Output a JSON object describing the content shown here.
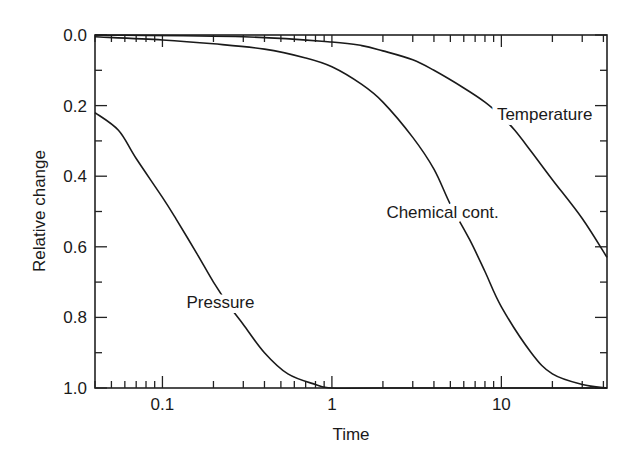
{
  "chart_data": {
    "type": "line",
    "title": "",
    "xlabel": "Time",
    "ylabel": "Relative change",
    "xscale": "log",
    "xlim": [
      0.04,
      42
    ],
    "ylim": [
      0.0,
      1.0
    ],
    "y_inverted": true,
    "grid": false,
    "legend": "none (inline curve labels)",
    "x_tick_labels": [
      "0.1",
      "1",
      "10"
    ],
    "x_tick_values": [
      0.1,
      1,
      10
    ],
    "y_tick_labels": [
      "0.0",
      "0.2",
      "0.4",
      "0.6",
      "0.8",
      "1.0"
    ],
    "y_tick_values": [
      0.0,
      0.2,
      0.4,
      0.6,
      0.8,
      1.0
    ],
    "series": [
      {
        "name": "Pressure",
        "label": "Pressure",
        "x": [
          0.04,
          0.055,
          0.07,
          0.1,
          0.12,
          0.16,
          0.2,
          0.25,
          0.3,
          0.4,
          0.55,
          0.8,
          1.0,
          2.0,
          42
        ],
        "values": [
          0.22,
          0.27,
          0.35,
          0.46,
          0.52,
          0.62,
          0.7,
          0.77,
          0.82,
          0.9,
          0.96,
          0.99,
          1.0,
          1.0,
          1.0
        ]
      },
      {
        "name": "Chemical cont.",
        "label": "Chemical cont.",
        "x": [
          0.04,
          0.1,
          0.2,
          0.4,
          0.7,
          1.0,
          1.5,
          2.0,
          3.0,
          4.0,
          5.0,
          6.5,
          8.0,
          10.0,
          15.0,
          20.0,
          30.0,
          42
        ],
        "values": [
          0.005,
          0.014,
          0.025,
          0.04,
          0.065,
          0.09,
          0.14,
          0.19,
          0.29,
          0.38,
          0.48,
          0.58,
          0.67,
          0.77,
          0.9,
          0.96,
          0.99,
          1.0
        ]
      },
      {
        "name": "Temperature",
        "label": "Temperature",
        "x": [
          0.04,
          0.3,
          1.0,
          1.5,
          2.0,
          3.0,
          4.0,
          6.0,
          8.0,
          10.0,
          12.0,
          15.0,
          20.0,
          30.0,
          42
        ],
        "values": [
          0.0,
          0.005,
          0.02,
          0.03,
          0.045,
          0.07,
          0.1,
          0.15,
          0.19,
          0.23,
          0.27,
          0.33,
          0.41,
          0.52,
          0.63
        ]
      }
    ],
    "annotations": [
      {
        "text": "Pressure",
        "x": 0.22,
        "y": 0.755
      },
      {
        "text": "Chemical cont.",
        "x": 4.5,
        "y": 0.5
      },
      {
        "text": "Temperature",
        "x": 18.0,
        "y": 0.225
      }
    ]
  }
}
